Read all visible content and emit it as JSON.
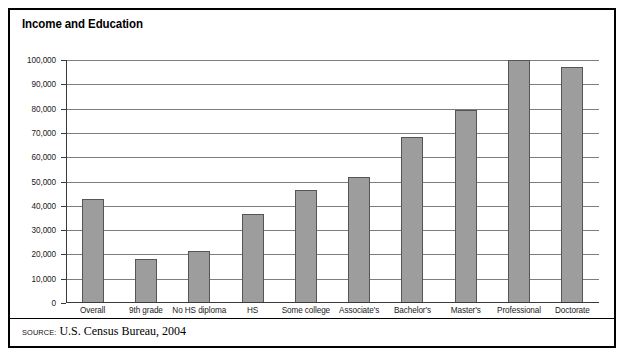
{
  "figure": {
    "title": "Income and Education",
    "source_label": "SOURCE:",
    "source_text": "U.S. Census Bureau, 2004",
    "border_color": "#000000",
    "bar_fill": "#9d9d9d",
    "bar_stroke": "#555555",
    "gridline_color": "#7d7d7d"
  },
  "chart_data": {
    "type": "bar",
    "title": "Income and Education",
    "xlabel": "",
    "ylabel": "",
    "ylim": [
      0,
      100000
    ],
    "ytick_step": 10000,
    "grid": true,
    "legend": false,
    "categories": [
      "Overall",
      "9th grade",
      "No HS diploma",
      "HS",
      "Some college",
      "Associate's",
      "Bachelor's",
      "Master's",
      "Professional",
      "Doctorate"
    ],
    "values": [
      43000,
      18000,
      21500,
      36500,
      46500,
      52000,
      68500,
      79500,
      100000,
      97000
    ],
    "ytick_labels": [
      "0",
      "10,000",
      "20,000",
      "30,000",
      "40,000",
      "50,000",
      "60,000",
      "70,000",
      "80,000",
      "90,000",
      "100,000"
    ],
    "ytick_values": [
      0,
      10000,
      20000,
      30000,
      40000,
      50000,
      60000,
      70000,
      80000,
      90000,
      100000
    ]
  }
}
